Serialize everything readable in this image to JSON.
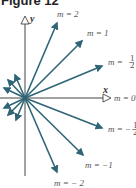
{
  "figure": {
    "title": "Figure 12",
    "axis_x_label": "x",
    "axis_y_label": "y",
    "colors": {
      "arrow": "#2f6577",
      "axis": "#333333",
      "label": "#555555"
    },
    "lines": [
      {
        "label": "m = 2",
        "slope": "2"
      },
      {
        "label": "m = 1",
        "slope": "1"
      },
      {
        "label": "m = 1/2",
        "slope": "1/2"
      },
      {
        "label": "m = 0",
        "slope": "0"
      },
      {
        "label": "m = −1/2",
        "slope": "-1/2"
      },
      {
        "label": "m = −1",
        "slope": "-1"
      },
      {
        "label": "m = −2",
        "slope": "-2"
      }
    ],
    "label_m2": "m = 2",
    "label_m1": "m = 1",
    "label_mhalf_prefix": "m = ",
    "label_m0": "m = 0",
    "label_mneghalf_prefix": "m = −",
    "label_mneg1": "m = −1",
    "label_mneg2": "m = − 2",
    "frac_num": "1",
    "frac_den": "2"
  }
}
